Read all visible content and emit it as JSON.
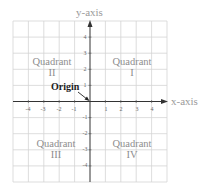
{
  "diagram": {
    "axes": {
      "x_label": "x-axis",
      "y_label": "y-axis",
      "x_ticks": [
        "-4",
        "-3",
        "-2",
        "-1",
        "1",
        "2",
        "3",
        "4"
      ],
      "y_ticks": [
        "4",
        "3",
        "2",
        "1",
        "-1",
        "-2",
        "-3",
        "-4"
      ],
      "range": [
        -5,
        5
      ]
    },
    "quadrants": [
      {
        "word": "Quadrant",
        "numeral": "I"
      },
      {
        "word": "Quadrant",
        "numeral": "II"
      },
      {
        "word": "Quadrant",
        "numeral": "III"
      },
      {
        "word": "Quadrant",
        "numeral": "IV"
      }
    ],
    "origin_label": "Origin",
    "colors": {
      "grid": "#d4d4d4",
      "axis": "#333333",
      "label_text": "#8a8a8a",
      "origin_text": "#222222"
    }
  }
}
